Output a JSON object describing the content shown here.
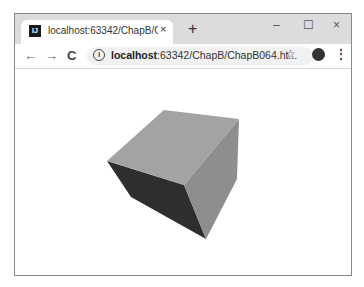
{
  "browser": {
    "tab": {
      "favicon_text": "IJ",
      "title": "localhost:63342/ChapB/ChapB",
      "close_glyph": "×"
    },
    "new_tab_glyph": "+",
    "window_controls": {
      "minimize": "–",
      "maximize": "☐",
      "close": "×"
    },
    "toolbar": {
      "back_glyph": "←",
      "forward_glyph": "→",
      "reload_glyph": "C",
      "info_glyph": "i",
      "url_host": "localhost",
      "url_rest": ":63342/ChapB/ChapB064.ht...",
      "star_glyph": "☆",
      "menu_glyph": "⋮"
    }
  },
  "scene": {
    "object": "cube",
    "colors": {
      "top": "#a3a3a3",
      "right": "#8e8e8e",
      "left_dark": "#2e2e2e"
    },
    "vertices": {
      "top_back": [
        163,
        109
      ],
      "top_right": [
        238,
        118
      ],
      "left": [
        106,
        160
      ],
      "front_top": [
        183,
        184
      ],
      "bottom": [
        205,
        238
      ],
      "right_bottom": [
        236,
        178
      ]
    }
  }
}
